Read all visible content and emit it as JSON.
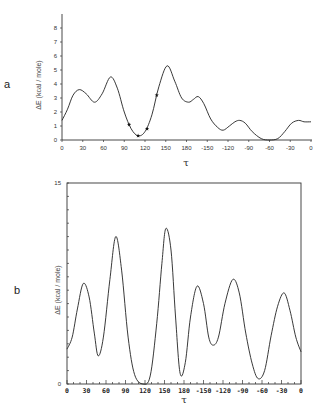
{
  "chart_data": [
    {
      "panel_label": "a",
      "type": "line",
      "xlabel": "τ",
      "ylabel": "ΔE (kcal / mole)",
      "x_tick_labels": [
        "0",
        "30",
        "60",
        "90",
        "120",
        "150",
        "180",
        "-150",
        "-120",
        "-90",
        "-60",
        "-30",
        "0"
      ],
      "y_tick_labels": [
        "0",
        "1",
        "2",
        "3",
        "4",
        "5",
        "6",
        "7",
        "8"
      ],
      "xlim": [
        0,
        360
      ],
      "ylim": [
        0,
        8
      ],
      "grid": false,
      "series": [
        {
          "name": "energy",
          "x": [
            0,
            8,
            16,
            25,
            35,
            47,
            58,
            70,
            80,
            90,
            100,
            110,
            120,
            130,
            140,
            152,
            163,
            173,
            183,
            190,
            197,
            205,
            215,
            225,
            233,
            242,
            250,
            257,
            265,
            275,
            288,
            300,
            312,
            322,
            332,
            342,
            350,
            360
          ],
          "y": [
            1.4,
            2.2,
            3.2,
            3.6,
            3.3,
            2.7,
            3.3,
            4.5,
            3.7,
            2.0,
            0.8,
            0.3,
            0.6,
            1.8,
            3.8,
            5.3,
            4.2,
            3.0,
            2.7,
            2.9,
            3.1,
            2.6,
            1.5,
            0.9,
            0.7,
            1.0,
            1.3,
            1.4,
            1.2,
            0.6,
            0.1,
            0.0,
            0.1,
            0.6,
            1.2,
            1.4,
            1.3,
            1.3
          ]
        }
      ],
      "markers": {
        "symbol": "star",
        "x": [
          97,
          110,
          123,
          137
        ],
        "y": [
          1.1,
          0.3,
          0.8,
          3.2
        ]
      }
    },
    {
      "panel_label": "b",
      "type": "line",
      "xlabel": "τ",
      "ylabel": "ΔE (kcal / mole)",
      "x_tick_labels": [
        "0",
        "30",
        "60",
        "90",
        "120",
        "150",
        "180",
        "-150",
        "-120",
        "-90",
        "-60",
        "-30",
        "0"
      ],
      "y_tick_labels": [
        "0",
        "15"
      ],
      "xlim": [
        0,
        360
      ],
      "ylim": [
        0,
        15
      ],
      "grid": false,
      "series": [
        {
          "name": "energy",
          "x": [
            0,
            8,
            16,
            25,
            34,
            42,
            48,
            56,
            66,
            75,
            84,
            94,
            104,
            117,
            128,
            138,
            146,
            152,
            160,
            167,
            174,
            182,
            190,
            200,
            210,
            218,
            225,
            233,
            243,
            255,
            265,
            275,
            285,
            294,
            304,
            314,
            324,
            334,
            343,
            352,
            360
          ],
          "y": [
            2.6,
            3.5,
            5.6,
            7.5,
            6.5,
            3.8,
            2.1,
            3.5,
            7.8,
            11.0,
            8.5,
            3.5,
            0.7,
            0.0,
            0.6,
            4.5,
            9.0,
            11.6,
            10.0,
            5.0,
            0.8,
            1.6,
            5.0,
            7.3,
            6.0,
            3.5,
            2.9,
            3.5,
            6.0,
            7.8,
            6.8,
            3.8,
            1.5,
            0.4,
            1.0,
            3.6,
            5.8,
            6.8,
            5.5,
            3.5,
            2.4
          ]
        }
      ]
    }
  ]
}
